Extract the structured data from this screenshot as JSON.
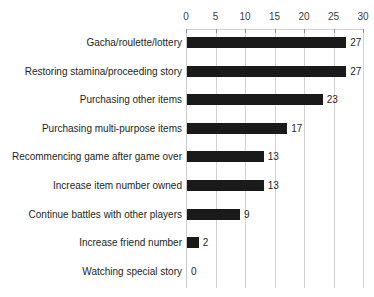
{
  "chart_data": {
    "type": "bar",
    "orientation": "horizontal",
    "title": "",
    "subtitle": "",
    "xlabel": "",
    "ylabel": "",
    "xlim": [
      0,
      30
    ],
    "xticks": [
      0,
      5,
      10,
      15,
      20,
      25,
      30
    ],
    "xtick_labels": [
      "0",
      "5",
      "10",
      "15",
      "20",
      "25",
      "30"
    ],
    "grid": true,
    "grid_axis": "x",
    "legend": false,
    "legend_position": "none",
    "axis_position": "top",
    "bar_color": "#1a1a1a",
    "gridline_color": "#d2d2d2",
    "text_color": "#231f20",
    "background_color": "#ffffff",
    "categories": [
      "Gacha/roulette/lottery",
      "Restoring stamina/proceeding story",
      "Purchasing other items",
      "Purchasing multi-purpose items",
      "Recommencing game after game over",
      "Increase item number owned",
      "Continue battles with other players",
      "Increase friend number",
      "Watching special story"
    ],
    "values": [
      27,
      27,
      23,
      17,
      13,
      13,
      9,
      2,
      0
    ],
    "value_labels": [
      "27",
      "27",
      "23",
      "17",
      "13",
      "13",
      "9",
      "2",
      "0"
    ]
  }
}
